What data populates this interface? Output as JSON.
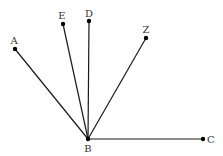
{
  "diagram": {
    "type": "geometry-rays",
    "background": "#ffffff",
    "line_color": "#1a1a1a",
    "point_color": "#000000",
    "vertex": "B",
    "points": [
      {
        "id": "A",
        "label": "A",
        "x": 15,
        "y": 49,
        "lx": 14,
        "ly": 44,
        "anchor": "middle"
      },
      {
        "id": "E",
        "label": "E",
        "x": 63,
        "y": 24,
        "lx": 62,
        "ly": 19,
        "anchor": "middle"
      },
      {
        "id": "D",
        "label": "D",
        "x": 89,
        "y": 21,
        "lx": 89,
        "ly": 17,
        "anchor": "middle"
      },
      {
        "id": "Z",
        "label": "Z",
        "x": 146,
        "y": 38,
        "lx": 146,
        "ly": 33,
        "anchor": "middle"
      },
      {
        "id": "B",
        "label": "B",
        "x": 88,
        "y": 139,
        "lx": 88,
        "ly": 152,
        "anchor": "middle"
      },
      {
        "id": "C",
        "label": "C",
        "x": 203,
        "y": 139,
        "lx": 207,
        "ly": 143,
        "anchor": "start"
      }
    ],
    "segments": [
      [
        "B",
        "A"
      ],
      [
        "B",
        "E"
      ],
      [
        "B",
        "D"
      ],
      [
        "B",
        "Z"
      ],
      [
        "B",
        "C"
      ]
    ]
  }
}
